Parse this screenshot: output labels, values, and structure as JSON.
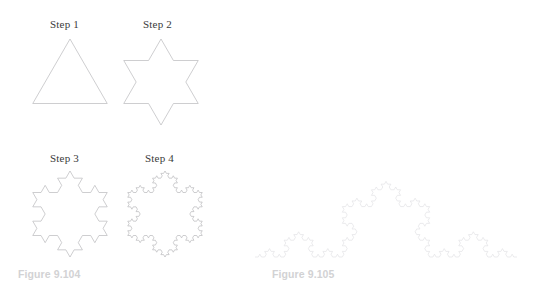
{
  "page": {
    "background_color": "#ffffff",
    "width": 537,
    "height": 287
  },
  "figures": [
    {
      "id": "figure-9-104",
      "caption": "Figure 9.104",
      "caption_color": "#d2d2d4",
      "caption_pos": {
        "x": 18,
        "y": 268
      },
      "panels": [
        {
          "id": "step-1",
          "label": "Step 1",
          "label_pos": {
            "x": 50,
            "y": 18
          },
          "shape": "koch-snowflake",
          "iterations": 0,
          "stroke_color": "#b9b9bc",
          "viewbox": {
            "x": 28,
            "y": 32,
            "w": 86,
            "h": 88
          },
          "center": {
            "x": 70,
            "y": 82
          },
          "radius": 43,
          "rotation_deg": -90
        },
        {
          "id": "step-2",
          "label": "Step 2",
          "label_pos": {
            "x": 143,
            "y": 18
          },
          "shape": "koch-snowflake",
          "iterations": 1,
          "stroke_color": "#b9b9bc",
          "viewbox": {
            "x": 118,
            "y": 32,
            "w": 86,
            "h": 102
          },
          "center": {
            "x": 161,
            "y": 82
          },
          "radius": 43,
          "rotation_deg": -90
        },
        {
          "id": "step-3",
          "label": "Step 3",
          "label_pos": {
            "x": 50,
            "y": 152
          },
          "shape": "koch-snowflake",
          "iterations": 2,
          "stroke_color": "#b9b9bc",
          "viewbox": {
            "x": 26,
            "y": 166,
            "w": 90,
            "h": 100
          },
          "center": {
            "x": 70,
            "y": 214
          },
          "radius": 43,
          "rotation_deg": -90
        },
        {
          "id": "step-4",
          "label": "Step 4",
          "label_pos": {
            "x": 145,
            "y": 152
          },
          "shape": "koch-snowflake",
          "iterations": 3,
          "stroke_color": "#b9b9bc",
          "viewbox": {
            "x": 120,
            "y": 166,
            "w": 90,
            "h": 100
          },
          "center": {
            "x": 165,
            "y": 214
          },
          "radius": 43,
          "rotation_deg": -90
        }
      ]
    },
    {
      "id": "figure-9-105",
      "caption": "Figure 9.105",
      "caption_color": "#d2d2d4",
      "caption_pos": {
        "x": 272,
        "y": 268
      },
      "panels": [
        {
          "id": "koch-curve",
          "label": "",
          "shape": "koch-curve",
          "iterations": 4,
          "stroke_color": "#e2e2e5",
          "start": {
            "x": 255,
            "y": 257
          },
          "end": {
            "x": 517,
            "y": 257
          }
        }
      ]
    }
  ]
}
